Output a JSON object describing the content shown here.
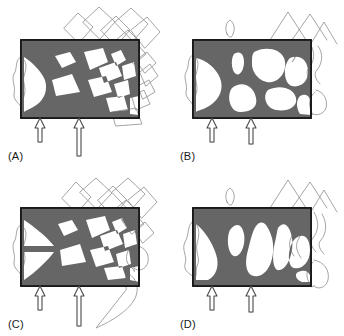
{
  "figure": {
    "type": "multi-panel-diagram",
    "title": "",
    "background_color": "#ffffff",
    "panel_count": 4,
    "layout": "2x2 grid"
  },
  "style": {
    "material_color": "#666666",
    "domain_border_color": "#111111",
    "mesh_outline_color": "#9a9a9a",
    "arrow_color": "#4a4a4a",
    "label_color": "#1a1a1a"
  },
  "panels": [
    {
      "id": "panel-a",
      "label": "(A)",
      "position": "top-left",
      "domain": {
        "x": 21,
        "y": 40,
        "w": 118,
        "h": 78
      },
      "load_arrows": [
        {
          "x": 40,
          "y_top": 118,
          "length": 24,
          "direction": "up"
        },
        {
          "x": 79,
          "y_top": 118,
          "length": 36,
          "direction": "up"
        }
      ],
      "material_outline": "M21,40 L139,40 L139,118 L21,118 Z",
      "hole_count": 7,
      "description": "Optimized truss-like structure with angular polygonal voids"
    },
    {
      "id": "panel-b",
      "label": "(B)",
      "position": "top-right",
      "domain": {
        "x": 21,
        "y": 40,
        "w": 118,
        "h": 78
      },
      "load_arrows": [
        {
          "x": 40,
          "y_top": 118,
          "length": 24,
          "direction": "up"
        },
        {
          "x": 79,
          "y_top": 118,
          "length": 26,
          "direction": "up"
        }
      ],
      "hole_count": 6,
      "description": "Optimized structure with large rounded voids, coarser members"
    },
    {
      "id": "panel-c",
      "label": "(C)",
      "position": "bottom-left",
      "domain": {
        "x": 21,
        "y": 40,
        "w": 118,
        "h": 78
      },
      "load_arrows": [
        {
          "x": 40,
          "y_top": 118,
          "length": 24,
          "direction": "up"
        },
        {
          "x": 79,
          "y_top": 118,
          "length": 38,
          "direction": "up"
        }
      ],
      "hole_count": 7,
      "description": "Optimized structure similar to (A) with angular diamond voids"
    },
    {
      "id": "panel-d",
      "label": "(D)",
      "position": "bottom-right",
      "domain": {
        "x": 21,
        "y": 40,
        "w": 118,
        "h": 78
      },
      "load_arrows": [
        {
          "x": 40,
          "y_top": 118,
          "length": 24,
          "direction": "up"
        },
        {
          "x": 79,
          "y_top": 118,
          "length": 26,
          "direction": "up"
        }
      ],
      "hole_count": 5,
      "description": "Optimized structure with tall triangular and teardrop voids"
    }
  ]
}
